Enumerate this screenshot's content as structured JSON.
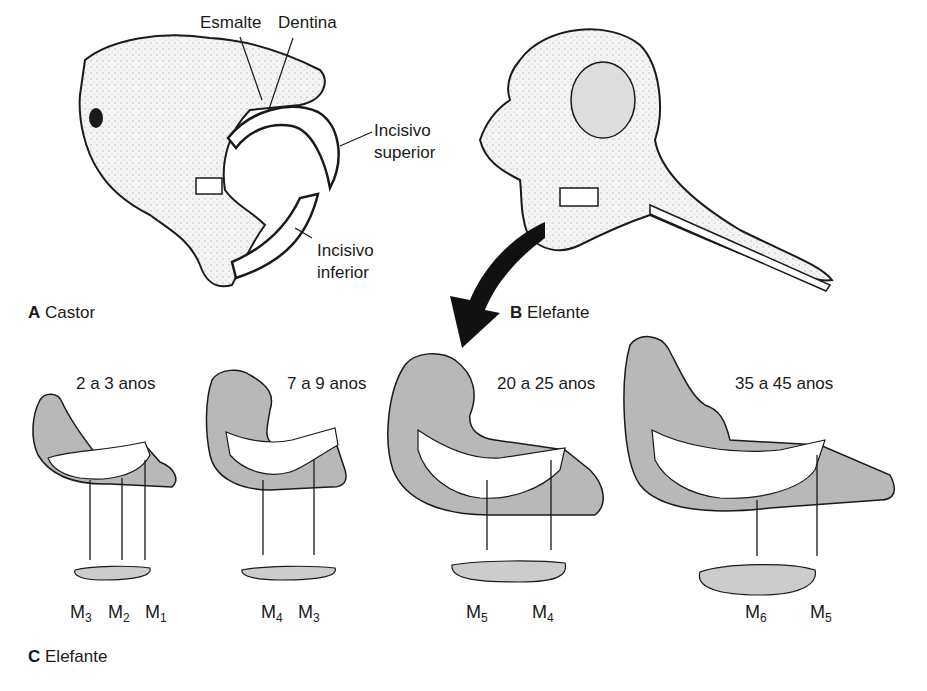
{
  "figure": {
    "panels": [
      {
        "letter": "A",
        "title": "Castor"
      },
      {
        "letter": "B",
        "title": "Elefante"
      },
      {
        "letter": "C",
        "title": "Elefante"
      }
    ],
    "beaver_labels": {
      "enamel": "Esmalte",
      "dentin": "Dentina",
      "upper_incisor_line1": "Incisivo",
      "upper_incisor_line2": "superior",
      "lower_incisor_line1": "Incisivo",
      "lower_incisor_line2": "inferior"
    },
    "jaw_stages": [
      {
        "age": "2 a 3 anos",
        "molars": [
          {
            "m": "M",
            "n": "3"
          },
          {
            "m": "M",
            "n": "2"
          },
          {
            "m": "M",
            "n": "1"
          }
        ]
      },
      {
        "age": "7 a 9 anos",
        "molars": [
          {
            "m": "M",
            "n": "4"
          },
          {
            "m": "M",
            "n": "3"
          }
        ]
      },
      {
        "age": "20 a 25 anos",
        "molars": [
          {
            "m": "M",
            "n": "5"
          },
          {
            "m": "M",
            "n": "4"
          }
        ]
      },
      {
        "age": "35 a 45 anos",
        "molars": [
          {
            "m": "M",
            "n": "6"
          },
          {
            "m": "M",
            "n": "5"
          }
        ]
      }
    ],
    "colors": {
      "bone_gray": "#b8b8b8",
      "ink": "#1a1a1a",
      "tooth": "#ffffff"
    }
  }
}
